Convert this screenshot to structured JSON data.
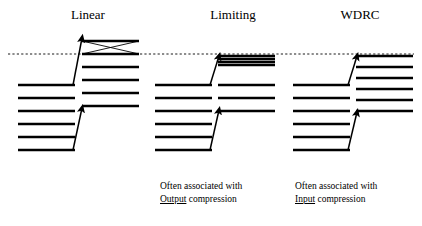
{
  "figure": {
    "title_row": [
      {
        "id": "linear",
        "label": "Linear"
      },
      {
        "id": "limiting",
        "label": "Limiting"
      },
      {
        "id": "wdrc",
        "label": "WDRC"
      }
    ],
    "threshold_line": {
      "name": "discomfort-threshold-dashed-line",
      "style": "dashed",
      "y": 54,
      "x_start": 8,
      "x_end": 414,
      "color": "#000000"
    },
    "colors": {
      "ink": "#000000",
      "background": "#ffffff"
    },
    "panels": [
      {
        "id": "linear",
        "label": "Linear",
        "caption_line1": "",
        "caption_keyword": "",
        "caption_line2": "",
        "input_lines_y": [
          85,
          98,
          111,
          124,
          137,
          150
        ],
        "input_x": [
          18,
          75
        ],
        "output_lines_y": [
          41,
          54,
          67,
          80,
          93,
          106
        ],
        "output_x": [
          82,
          139
        ],
        "has_crossing_x": true,
        "crossing_band": {
          "top": 41,
          "bottom": 54,
          "x_start": 82,
          "x_end": 139
        },
        "arrows": [
          {
            "name": "upper-gain-arrow",
            "x1": 73,
            "y1": 85,
            "x2": 82,
            "y2": 38
          },
          {
            "name": "lower-gain-arrow",
            "x1": 73,
            "y1": 150,
            "x2": 82,
            "y2": 108
          }
        ]
      },
      {
        "id": "limiting",
        "label": "Limiting",
        "caption_line1": "Often associated with",
        "caption_keyword": "Output",
        "caption_line2": " compression",
        "input_lines_y": [
          85,
          98,
          111,
          124,
          137,
          150
        ],
        "input_x": [
          155,
          212
        ],
        "output_lines_y": [
          56,
          59,
          62,
          65,
          85,
          98,
          111
        ],
        "output_x": [
          218,
          275
        ],
        "has_crossing_x": false,
        "compressed_top_count": 4,
        "arrows": [
          {
            "name": "upper-gain-arrow",
            "x1": 210,
            "y1": 85,
            "x2": 219,
            "y2": 56
          },
          {
            "name": "lower-gain-arrow",
            "x1": 210,
            "y1": 150,
            "x2": 219,
            "y2": 110
          }
        ]
      },
      {
        "id": "wdrc",
        "label": "WDRC",
        "caption_line1": "Often associated with",
        "caption_keyword": "Input",
        "caption_line2": " compression",
        "input_lines_y": [
          85,
          98,
          111,
          124,
          137,
          150
        ],
        "input_x": [
          293,
          350
        ],
        "output_lines_y": [
          56,
          67,
          78,
          89,
          100,
          111
        ],
        "output_x": [
          356,
          413
        ],
        "has_crossing_x": false,
        "arrows": [
          {
            "name": "upper-gain-arrow",
            "x1": 348,
            "y1": 85,
            "x2": 357,
            "y2": 56
          },
          {
            "name": "lower-gain-arrow",
            "x1": 348,
            "y1": 150,
            "x2": 357,
            "y2": 112
          }
        ]
      }
    ]
  }
}
